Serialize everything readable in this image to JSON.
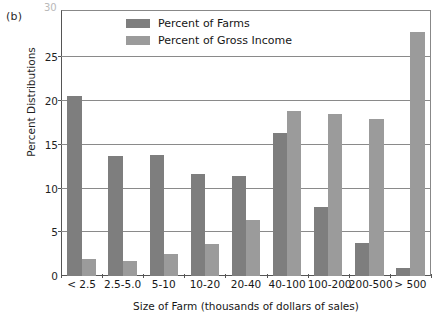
{
  "figure": {
    "panel_label": "(b)",
    "top_tick_faint": "30"
  },
  "legend": {
    "position": "top-center-inside",
    "entries": [
      {
        "label": "Percent of Farms",
        "color": "#7e7e7e",
        "key": "farms"
      },
      {
        "label": "Percent of Gross Income",
        "color": "#9b9b9b",
        "key": "income"
      }
    ]
  },
  "chart_data": {
    "type": "bar",
    "title": "",
    "subtitle": "",
    "xlabel": "Size of Farm (thousands of dollars of sales)",
    "ylabel": "Percent Distributions",
    "categories": [
      "< 2.5",
      "2.5-5.0",
      "5-10",
      "10-20",
      "20-40",
      "40-100",
      "100-200",
      "200-500",
      "> 500"
    ],
    "series": [
      {
        "name": "Percent of Farms",
        "color": "#7e7e7e",
        "values": [
          20.6,
          13.7,
          13.8,
          11.7,
          11.4,
          16.3,
          7.9,
          3.8,
          0.9
        ]
      },
      {
        "name": "Percent of Gross Income",
        "color": "#9b9b9b",
        "values": [
          2.0,
          1.7,
          2.5,
          3.7,
          6.4,
          18.9,
          18.5,
          18.0,
          27.9
        ]
      }
    ],
    "ylim": [
      0,
      27.9
    ],
    "yticks": [
      0,
      5,
      10,
      15,
      20,
      25
    ],
    "ytick_labels": [
      "0",
      "5",
      "10",
      "15",
      "20",
      "25"
    ],
    "grid": true,
    "grid_axis": "y",
    "legend_position": "upper center"
  }
}
